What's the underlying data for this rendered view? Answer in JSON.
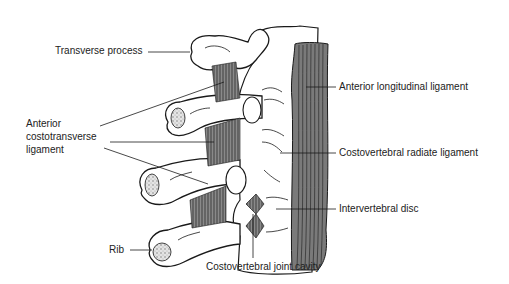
{
  "figure": {
    "colors": {
      "line": "#1a1a1a",
      "ligament_fill": "#6e6e6e",
      "ligament_band": "#5a5a5a",
      "bone_fill": "#ffffff",
      "cancellous": "#b8b8b8"
    }
  },
  "labels": {
    "transverse_process": "Transverse process",
    "anterior_costotransverse_1": "Anterior",
    "anterior_costotransverse_2": "costotransverse",
    "anterior_costotransverse_3": "ligament",
    "rib": "Rib",
    "anterior_longitudinal_ligament": "Anterior longitudinal ligament",
    "costovertebral_radiate_ligament": "Costovertebral radiate ligament",
    "intervertebral_disc": "Intervertebral disc",
    "costovertebral_joint_cavity": "Costovertebral joint cavity"
  }
}
